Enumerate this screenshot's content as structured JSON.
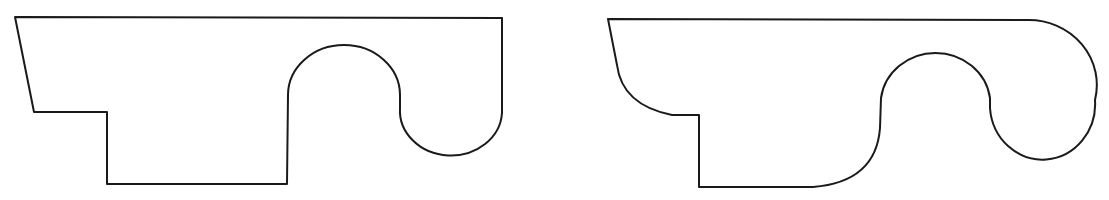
{
  "figure": {
    "stroke_color": "#1a1a1a",
    "background": "#ffffff",
    "shapes": [
      {
        "name": "sharp-corner-profile",
        "path": "M15,17 L502,18 L502,113 A51,45 0 0 1 400,108 L400,95 A56,50 0 0 0 288,95 L287,184 L107,184 L107,112 L34,112 Z"
      },
      {
        "name": "rounded-corner-profile",
        "path": "M608,19 L1028,20 A68,65 0 0 1 1095,100 A52,55 0 0 1 990,108 L990,98 A55,52 0 0 0 881,98 L880,128 Q876,182 813,187 L699,187 L699,115 L672,115 Q622,105 617,65 Z"
      }
    ]
  }
}
